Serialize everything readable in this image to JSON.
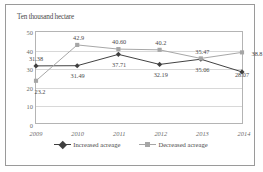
{
  "chart_data": {
    "type": "line",
    "title": "",
    "axis_unit_label": "Ten thousand hectare",
    "xlabel": "",
    "ylabel": "Ten thousand hectare",
    "categories": [
      "2009",
      "2010",
      "2011",
      "2012",
      "2013",
      "2014"
    ],
    "series": [
      {
        "name": "Increased acreage",
        "color": "#3f3f3f",
        "marker": "diamond",
        "values": [
          31.38,
          31.49,
          37.71,
          32.19,
          35.06,
          28.07
        ],
        "labels": [
          "31.38",
          "31.49",
          "37.71",
          "32.19",
          "35.06",
          "28.07"
        ]
      },
      {
        "name": "Decreased acreage",
        "color": "#a6a6a6",
        "marker": "square",
        "values": [
          23.2,
          42.9,
          40.6,
          40.2,
          35.47,
          38.8
        ],
        "labels": [
          "23.2",
          "42.9",
          "40.60",
          "40.2",
          "35.47",
          "38.8"
        ]
      }
    ],
    "yticks": [
      "0",
      "10",
      "20",
      "30",
      "40",
      "50"
    ],
    "ylim": [
      0,
      50
    ],
    "grid": true,
    "legend_position": "bottom"
  }
}
